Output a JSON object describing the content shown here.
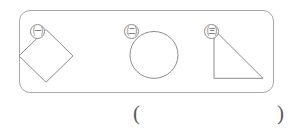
{
  "worksheet": {
    "figure_box": {
      "label": "figure group box",
      "items": [
        {
          "marker": "㈠",
          "marker_name": "circled-korean-giyeok",
          "shape": "rhombus",
          "shape_label": "diamond",
          "points": "53,46 26,19 -1,46 26,73"
        },
        {
          "marker": "㈡",
          "marker_name": "circled-korean-nieun",
          "shape": "circle",
          "shape_label": "circle",
          "cx": "39",
          "cy": "45",
          "r": "24"
        },
        {
          "marker": "㈢",
          "marker_name": "circled-korean-digeut",
          "shape": "right-triangle",
          "shape_label": "right triangle",
          "points": "19,19 19,69 68,69"
        }
      ]
    },
    "answer_blank": {
      "open_paren": "(",
      "close_paren": ")",
      "value": ""
    }
  },
  "colors": {
    "stroke": "#8a8a8a",
    "box_border": "#a8a8a8",
    "background": "#ffffff",
    "text": "#5f5f5f"
  }
}
